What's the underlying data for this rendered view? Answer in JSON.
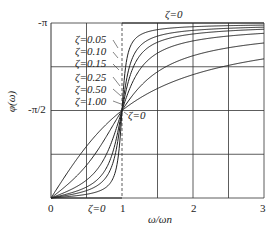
{
  "chart_data": {
    "type": "line",
    "title": "",
    "xlabel": "ω/ωn",
    "ylabel": "φ(ω)",
    "xlim": [
      0,
      3
    ],
    "ylim_labels": [
      "0",
      "-π/2",
      "-π"
    ],
    "x_ticks": [
      "0",
      "1",
      "2",
      "3"
    ],
    "y_ticks": [
      "-π",
      "-π/2"
    ],
    "grid": true,
    "series": [
      {
        "name": "ζ=0",
        "zeta": 0
      },
      {
        "name": "ζ=0.05",
        "zeta": 0.05
      },
      {
        "name": "ζ=0.10",
        "zeta": 0.1
      },
      {
        "name": "ζ=0.15",
        "zeta": 0.15
      },
      {
        "name": "ζ=0.25",
        "zeta": 0.25
      },
      {
        "name": "ζ=0.50",
        "zeta": 0.5
      },
      {
        "name": "ζ=1.00",
        "zeta": 1.0
      }
    ],
    "annotations": [
      "ζ=0",
      "ζ=0.05",
      "ζ=0.10",
      "ζ=0.15",
      "ζ=0.25",
      "ζ=0.50",
      "ζ=1.00",
      "ζ=0",
      "ζ=0"
    ]
  },
  "labels": {
    "y_top": "-π",
    "y_mid": "-π/2",
    "y_axis": "φ(ω)",
    "x0": "0",
    "x1": "1",
    "x2": "2",
    "x3": "3",
    "x_axis": "ω/ωn",
    "zeta_top": "ζ=0",
    "zeta_mid": "ζ=0",
    "zeta_bottom": "ζ=0",
    "legend": [
      "ζ=0.05",
      "ζ=0.10",
      "ζ=0.15",
      "ζ=0.25",
      "ζ=0.50",
      "ζ=1.00"
    ]
  }
}
